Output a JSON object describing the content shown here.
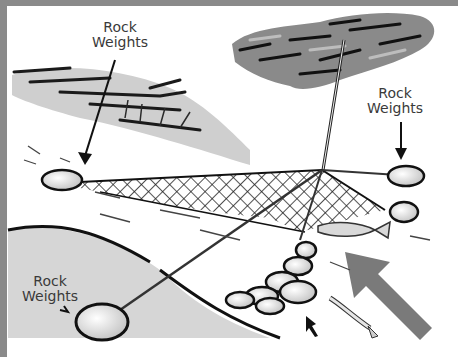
{
  "diagram": {
    "labels": [
      {
        "id": "top-left",
        "line1": "Rock",
        "line2": "Weights"
      },
      {
        "id": "top-right",
        "line1": "Rock",
        "line2": "Weights"
      },
      {
        "id": "bottom-left",
        "line1": "Rock",
        "line2": "Weights"
      }
    ],
    "colors": {
      "border": "#8a8a8a",
      "ink": "#1a1a1a",
      "arrow": "#7a7a7a",
      "foliage": "#6e6e6e",
      "water": "#e6e6e6"
    }
  }
}
